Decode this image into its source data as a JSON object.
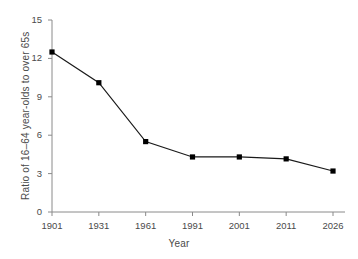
{
  "chart_data": {
    "type": "line",
    "title": "",
    "subtitle": "",
    "xlabel": "Year",
    "ylabel": "Ratio of 16–64 year-olds to over 65s",
    "categories": [
      "1901",
      "1931",
      "1961",
      "1991",
      "2001",
      "2011",
      "2026"
    ],
    "x": [
      1901,
      1931,
      1961,
      1991,
      2001,
      2011,
      2026
    ],
    "values": [
      12.5,
      10.1,
      5.5,
      4.3,
      4.3,
      4.15,
      3.2
    ],
    "series": [
      {
        "name": "Ratio of 16–64 year-olds to over 65s",
        "values": [
          12.5,
          10.1,
          5.5,
          4.3,
          4.3,
          4.15,
          3.2
        ]
      }
    ],
    "xtick_labels": [
      "1901",
      "1931",
      "1961",
      "1991",
      "2001",
      "2011",
      "2026"
    ],
    "ytick_labels": [
      "0",
      "3",
      "6",
      "9",
      "12",
      "15"
    ],
    "yticks": [
      0,
      3,
      6,
      9,
      12,
      15
    ],
    "ylim": [
      0,
      15
    ],
    "grid": false,
    "legend": false,
    "legend_position": "none",
    "marker": "square",
    "line_color": "#1a1a1a",
    "marker_color": "#000000",
    "axis_color": "#8a8a8a",
    "text_color": "#4a4a4a",
    "background_color": "#ffffff",
    "annotations": []
  }
}
